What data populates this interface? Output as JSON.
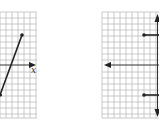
{
  "figures": [
    {
      "id": "left-graph",
      "grid": {
        "x0": 0,
        "y0": 12,
        "x1": 37,
        "y1": 118,
        "step": 6
      },
      "axis_x": {
        "y": 65,
        "arrow": "right",
        "label": "x"
      },
      "segment": {
        "from": [
          0,
          95
        ],
        "to": [
          22,
          35
        ],
        "endpoints": [
          "open-left-edge",
          "dot"
        ]
      }
    },
    {
      "id": "right-graph",
      "grid": {
        "x0": 102,
        "y0": 12,
        "x1": 159,
        "y1": 118,
        "step": 6
      },
      "axis_x": {
        "y": 65,
        "arrow": "left"
      },
      "axis_y": {
        "x": 157,
        "arrows": [
          "up",
          "down"
        ]
      },
      "rays": [
        {
          "from": [
            144,
            35
          ],
          "direction": "right"
        },
        {
          "from": [
            144,
            95
          ],
          "direction": "right"
        }
      ]
    }
  ],
  "labels": {
    "x_axis": "x"
  },
  "colors": {
    "grid": "#bdbdbd",
    "ink": "#222222",
    "background": "#ffffff"
  }
}
